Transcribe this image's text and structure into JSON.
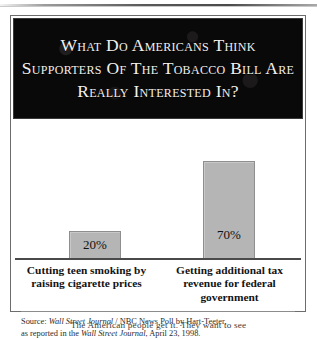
{
  "figure": {
    "title": "What Do Americans Think Supporters Of The Tobacco Bill Are Really Interested In?",
    "source_prefix": "Source: ",
    "source_pub_1": "Wall Street Journal",
    "source_mid": " / NBC News Poll by Hart-Teeter,",
    "source_line2_prefix": "as reported in the ",
    "source_pub_2": "Wall Street Journal",
    "source_line2_suffix": ", April 23, 1998."
  },
  "chart_data": {
    "type": "bar",
    "title": "What Do Americans Think Supporters Of The Tobacco Bill Are Really Interested In?",
    "categories": [
      "Cutting teen smoking by raising cigarette prices",
      "Getting additional tax revenue for federal government"
    ],
    "values": [
      20,
      70
    ],
    "value_labels": [
      "20%",
      "70%"
    ],
    "xlabel": "",
    "ylabel": "",
    "ylim": [
      0,
      100
    ],
    "grid": false,
    "legend": "none",
    "bar_color": "#b5b5b5",
    "bar_border_color": "#8e8e8e",
    "banner_color": "#0a0909",
    "banner_text_color": "#f3f1ec"
  },
  "page": {
    "body_copy": "The American people get it. They want to see"
  }
}
